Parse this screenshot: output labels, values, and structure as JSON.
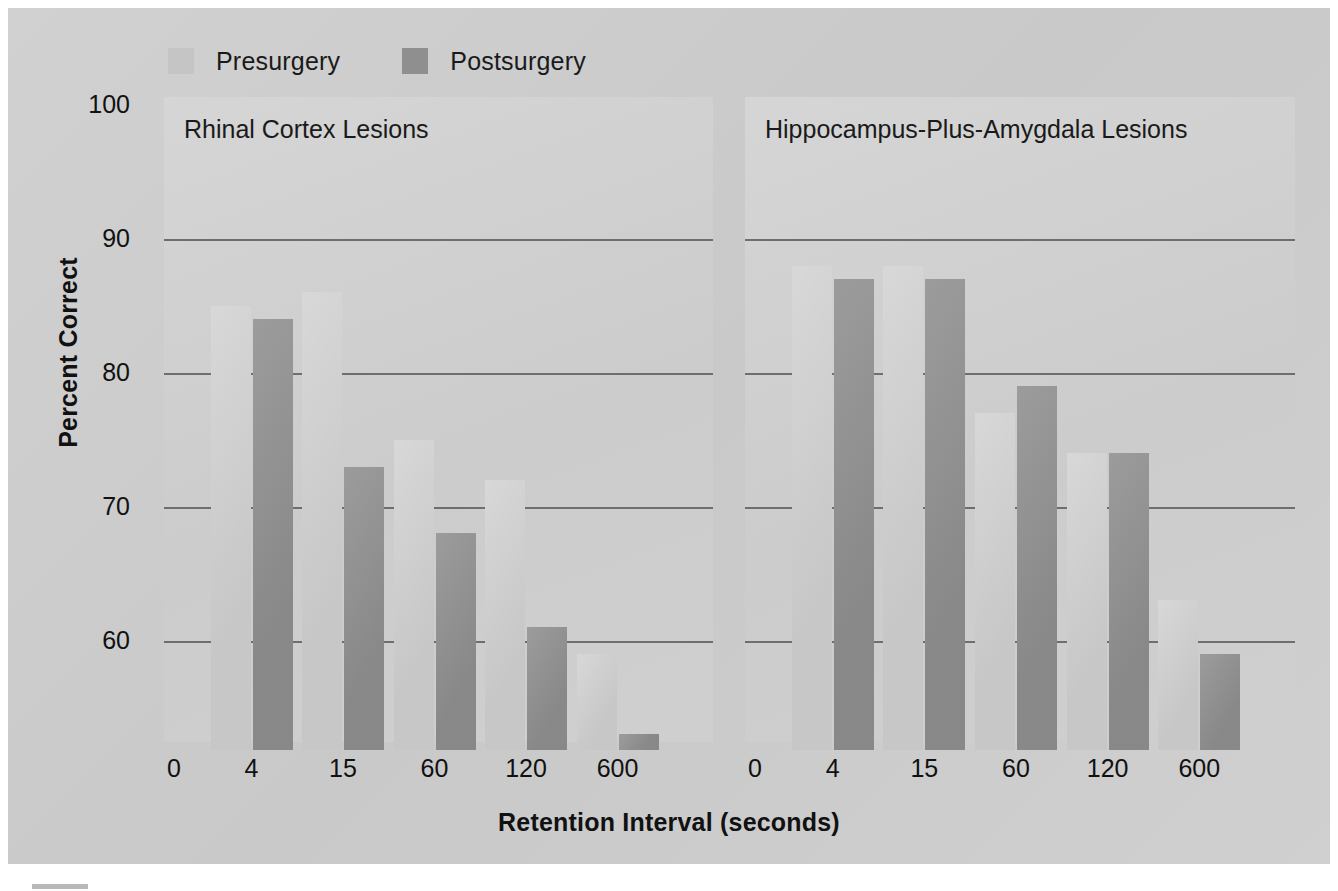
{
  "figure": {
    "background_color": "#c8c8c8",
    "panel_color": "#cacaca"
  },
  "legend": {
    "position": "top-left",
    "entries": [
      {
        "label": "Presurgery",
        "color": "#c5c5c5",
        "swatch_name": "legend-swatch-presurgery"
      },
      {
        "label": "Postsurgery",
        "color": "#8f8f8f",
        "swatch_name": "legend-swatch-postsurgery"
      }
    ]
  },
  "axes": {
    "ylabel": "Percent Correct",
    "xlabel": "Retention Interval (seconds)",
    "yticks": [
      "100",
      "90",
      "80",
      "70",
      "60"
    ],
    "xticks": [
      "0",
      "4",
      "15",
      "60",
      "120",
      "600"
    ]
  },
  "chart_data": {
    "type": "bar",
    "title": "",
    "xlabel": "Retention Interval (seconds)",
    "ylabel": "Percent Correct",
    "ylim": [
      51,
      100
    ],
    "yticks": [
      60,
      70,
      80,
      90,
      100
    ],
    "grid": true,
    "legend_position": "top-left",
    "categories": [
      "0",
      "4",
      "15",
      "60",
      "120",
      "600"
    ],
    "note": "First category '0' is an axis origin tick with no bars; bar pairs are drawn for 4, 15, 60, 120, 600.",
    "panels": [
      {
        "title": "Rhinal Cortex Lesions",
        "categories": [
          "4",
          "15",
          "60",
          "120",
          "600"
        ],
        "series": [
          {
            "name": "Presurgery",
            "color": "#c7c7c7",
            "values": [
              85,
              86,
              75,
              72,
              59
            ]
          },
          {
            "name": "Postsurgery",
            "color": "#8e8e8e",
            "values": [
              84,
              73,
              68,
              61,
              53
            ]
          }
        ]
      },
      {
        "title": "Hippocampus-Plus-Amygdala Lesions",
        "categories": [
          "4",
          "15",
          "60",
          "120",
          "600"
        ],
        "series": [
          {
            "name": "Presurgery",
            "color": "#c7c7c7",
            "values": [
              88,
              88,
              77,
              74,
              63
            ]
          },
          {
            "name": "Postsurgery",
            "color": "#8e8e8e",
            "values": [
              87,
              87,
              79,
              74,
              59
            ]
          }
        ]
      }
    ]
  }
}
